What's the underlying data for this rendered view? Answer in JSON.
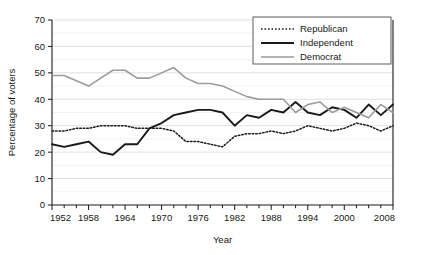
{
  "chart_data": {
    "type": "line",
    "title": "",
    "xlabel": "Year",
    "ylabel": "Percentage of voters",
    "xlim": [
      1952,
      2008
    ],
    "ylim": [
      0,
      70
    ],
    "ytick_step": 10,
    "yminor_step": 5,
    "xtick_step": 6,
    "xminor_step": 2,
    "grid": "horizontal",
    "legend_position": "top-right",
    "xticks": [
      1952,
      1958,
      1964,
      1970,
      1976,
      1982,
      1988,
      1994,
      2000,
      2008
    ],
    "xtick_labels": [
      "1952",
      "1958",
      "1964",
      "1970",
      "1976",
      "1982",
      "1988",
      "1994",
      "2000",
      "2008"
    ],
    "yticks": [
      0,
      10,
      20,
      30,
      40,
      50,
      60,
      70
    ],
    "ytick_labels": [
      "0",
      "10",
      "20",
      "30",
      "40",
      "50",
      "60",
      "70"
    ],
    "x": [
      1952,
      1954,
      1956,
      1958,
      1960,
      1962,
      1964,
      1966,
      1968,
      1970,
      1972,
      1974,
      1976,
      1978,
      1980,
      1982,
      1984,
      1986,
      1988,
      1990,
      1992,
      1994,
      1996,
      1998,
      2000,
      2002,
      2004,
      2006,
      2008
    ],
    "series": [
      {
        "name": "Republican",
        "style": "dotted",
        "color": "#1a1a1a",
        "width": 1.5,
        "values": [
          28,
          28,
          29,
          29,
          30,
          30,
          30,
          29,
          29,
          29,
          28,
          24,
          24,
          23,
          22,
          26,
          27,
          27,
          28,
          27,
          28,
          30,
          29,
          28,
          29,
          31,
          30,
          28,
          30
        ]
      },
      {
        "name": "Independent",
        "style": "solid",
        "color": "#1a1a1a",
        "width": 1.9,
        "values": [
          23,
          22,
          23,
          24,
          20,
          19,
          23,
          23,
          29,
          31,
          34,
          35,
          36,
          36,
          35,
          30,
          34,
          33,
          36,
          35,
          39,
          35,
          34,
          37,
          36,
          33,
          38,
          34,
          38
        ]
      },
      {
        "name": "Democrat",
        "style": "solid",
        "color": "#9b9b9b",
        "width": 1.6,
        "values": [
          49,
          49,
          47,
          45,
          48,
          51,
          51,
          48,
          48,
          50,
          52,
          48,
          46,
          46,
          45,
          43,
          41,
          40,
          40,
          40,
          35,
          38,
          39,
          35,
          37,
          35,
          33,
          38,
          35
        ]
      }
    ],
    "legend_entries": [
      {
        "label": "Republican",
        "style": "dotted",
        "color": "#1a1a1a"
      },
      {
        "label": "Independent",
        "style": "solid",
        "color": "#1a1a1a"
      },
      {
        "label": "Democrat",
        "style": "solid",
        "color": "#9b9b9b"
      }
    ]
  }
}
